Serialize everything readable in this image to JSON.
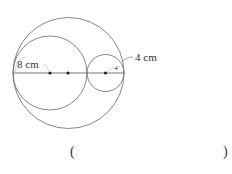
{
  "diagram": {
    "labels": {
      "left_radius": "8 cm",
      "small_radius": "4 cm"
    },
    "answer_blank": {
      "open": "(",
      "close": ")"
    },
    "colors": {
      "stroke": "#555555",
      "text": "#333333"
    }
  }
}
